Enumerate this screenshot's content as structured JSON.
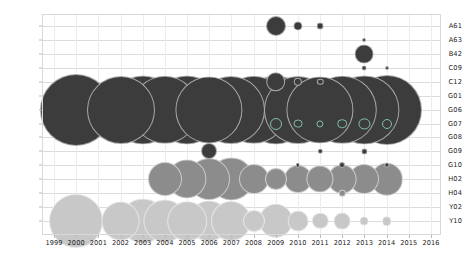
{
  "chart_data": {
    "type": "scatter",
    "title": "",
    "subtitle": "",
    "xlabel": "",
    "ylabel": "",
    "grid": true,
    "legend": "none",
    "bubble_encoding": "area",
    "x": [
      1999,
      2000,
      2001,
      2002,
      2003,
      2004,
      2005,
      2006,
      2007,
      2008,
      2009,
      2010,
      2011,
      2012,
      2013,
      2014,
      2015,
      2016
    ],
    "xlim": [
      1999,
      2016
    ],
    "categories": [
      "A61",
      "A63",
      "B42",
      "C09",
      "C12",
      "G01",
      "G06",
      "G07",
      "G08",
      "G09",
      "G10",
      "H02",
      "H04",
      "Y02",
      "Y10"
    ],
    "ylim": [
      "A61",
      "Y10"
    ],
    "colors": {
      "dark": "#3c3c3c",
      "medium": "#8c8c8c",
      "light": "#c8c8c8",
      "accent_ring": "#7fbfb0",
      "grid": "#dcdcdc",
      "axis_text": "#1d1d1d",
      "background": "#ffffff"
    },
    "points": [
      {
        "category": "A61",
        "year": 2009,
        "value": 38,
        "size": 10.0,
        "color": "#3c3c3c"
      },
      {
        "category": "A61",
        "year": 2010,
        "value": 9,
        "size": 4.6,
        "color": "#3c3c3c"
      },
      {
        "category": "A61",
        "year": 2011,
        "value": 5,
        "size": 3.4,
        "color": "#3c3c3c"
      },
      {
        "category": "A63",
        "year": 2013,
        "value": 2,
        "size": 2.0,
        "color": "#3c3c3c"
      },
      {
        "category": "B42",
        "year": 2013,
        "value": 34,
        "size": 9.4,
        "color": "#3c3c3c"
      },
      {
        "category": "C09",
        "year": 2013,
        "value": 3,
        "size": 2.4,
        "color": "#3c3c3c"
      },
      {
        "category": "C09",
        "year": 2014,
        "value": 2,
        "size": 2.0,
        "color": "#3c3c3c"
      },
      {
        "category": "C12",
        "year": 2009,
        "value": 37,
        "size": 9.8,
        "color": "#3c3c3c"
      },
      {
        "category": "C12",
        "year": 2010,
        "value": 8,
        "size": 4.2,
        "color": "#3c3c3c"
      },
      {
        "category": "C12",
        "year": 2011,
        "value": 5,
        "size": 3.2,
        "color": "#3c3c3c"
      },
      {
        "category": "G06",
        "year": 2000,
        "value": 560,
        "size": 36.0,
        "color": "#3c3c3c"
      },
      {
        "category": "G06",
        "year": 2002,
        "value": 505,
        "size": 34.0,
        "color": "#3c3c3c"
      },
      {
        "category": "G06",
        "year": 2003,
        "value": 520,
        "size": 34.6,
        "color": "#3c3c3c"
      },
      {
        "category": "G06",
        "year": 2004,
        "value": 512,
        "size": 34.2,
        "color": "#3c3c3c"
      },
      {
        "category": "G06",
        "year": 2005,
        "value": 520,
        "size": 34.6,
        "color": "#3c3c3c"
      },
      {
        "category": "G06",
        "year": 2006,
        "value": 498,
        "size": 33.6,
        "color": "#3c3c3c"
      },
      {
        "category": "G06",
        "year": 2007,
        "value": 505,
        "size": 34.0,
        "color": "#3c3c3c"
      },
      {
        "category": "G06",
        "year": 2008,
        "value": 512,
        "size": 34.2,
        "color": "#3c3c3c"
      },
      {
        "category": "G06",
        "year": 2009,
        "value": 520,
        "size": 34.6,
        "color": "#3c3c3c"
      },
      {
        "category": "G06",
        "year": 2010,
        "value": 505,
        "size": 34.0,
        "color": "#3c3c3c"
      },
      {
        "category": "G06",
        "year": 2011,
        "value": 498,
        "size": 33.6,
        "color": "#3c3c3c"
      },
      {
        "category": "G06",
        "year": 2012,
        "value": 512,
        "size": 34.2,
        "color": "#3c3c3c"
      },
      {
        "category": "G06",
        "year": 2013,
        "value": 520,
        "size": 34.6,
        "color": "#3c3c3c"
      },
      {
        "category": "G06",
        "year": 2014,
        "value": 530,
        "size": 35.0,
        "color": "#3c3c3c"
      },
      {
        "category": "G07",
        "year": 2009,
        "value": 14,
        "size": 6.0,
        "color": "#7fbfb0"
      },
      {
        "category": "G07",
        "year": 2010,
        "value": 8,
        "size": 4.4,
        "color": "#7fbfb0"
      },
      {
        "category": "G07",
        "year": 2011,
        "value": 6,
        "size": 3.6,
        "color": "#7fbfb0"
      },
      {
        "category": "G07",
        "year": 2012,
        "value": 9,
        "size": 4.8,
        "color": "#7fbfb0"
      },
      {
        "category": "G07",
        "year": 2013,
        "value": 12,
        "size": 5.6,
        "color": "#7fbfb0"
      },
      {
        "category": "G07",
        "year": 2014,
        "value": 10,
        "size": 5.0,
        "color": "#7fbfb0"
      },
      {
        "category": "G09",
        "year": 2006,
        "value": 42,
        "size": 8.0,
        "color": "#3c3c3c"
      },
      {
        "category": "G09",
        "year": 2011,
        "value": 3,
        "size": 2.2,
        "color": "#3c3c3c"
      },
      {
        "category": "G09",
        "year": 2013,
        "value": 4,
        "size": 2.6,
        "color": "#3c3c3c"
      },
      {
        "category": "G10",
        "year": 2010,
        "value": 3,
        "size": 2.2,
        "color": "#3c3c3c"
      },
      {
        "category": "G10",
        "year": 2012,
        "value": 5,
        "size": 3.0,
        "color": "#3c3c3c"
      },
      {
        "category": "G10",
        "year": 2014,
        "value": 4,
        "size": 2.6,
        "color": "#3c3c3c"
      },
      {
        "category": "H02",
        "year": 2004,
        "value": 150,
        "size": 17.0,
        "color": "#8c8c8c"
      },
      {
        "category": "H02",
        "year": 2005,
        "value": 190,
        "size": 19.6,
        "color": "#8c8c8c"
      },
      {
        "category": "H02",
        "year": 2006,
        "value": 215,
        "size": 21.0,
        "color": "#8c8c8c"
      },
      {
        "category": "H02",
        "year": 2007,
        "value": 225,
        "size": 21.6,
        "color": "#8c8c8c"
      },
      {
        "category": "H02",
        "year": 2008,
        "value": 120,
        "size": 15.0,
        "color": "#8c8c8c"
      },
      {
        "category": "H02",
        "year": 2009,
        "value": 70,
        "size": 11.0,
        "color": "#8c8c8c"
      },
      {
        "category": "H02",
        "year": 2010,
        "value": 110,
        "size": 14.0,
        "color": "#8c8c8c"
      },
      {
        "category": "H02",
        "year": 2011,
        "value": 105,
        "size": 13.6,
        "color": "#8c8c8c"
      },
      {
        "category": "H02",
        "year": 2012,
        "value": 115,
        "size": 14.4,
        "color": "#8c8c8c"
      },
      {
        "category": "H02",
        "year": 2013,
        "value": 120,
        "size": 15.0,
        "color": "#8c8c8c"
      },
      {
        "category": "H02",
        "year": 2014,
        "value": 140,
        "size": 16.2,
        "color": "#8c8c8c"
      },
      {
        "category": "H04",
        "year": 2012,
        "value": 6,
        "size": 3.2,
        "color": "#8c8c8c"
      },
      {
        "category": "Y10",
        "year": 2000,
        "value": 330,
        "size": 27.0,
        "color": "#c8c8c8"
      },
      {
        "category": "Y10",
        "year": 2002,
        "value": 180,
        "size": 19.4,
        "color": "#c8c8c8"
      },
      {
        "category": "Y10",
        "year": 2003,
        "value": 245,
        "size": 22.6,
        "color": "#c8c8c8"
      },
      {
        "category": "Y10",
        "year": 2004,
        "value": 225,
        "size": 21.6,
        "color": "#c8c8c8"
      },
      {
        "category": "Y10",
        "year": 2005,
        "value": 190,
        "size": 19.8,
        "color": "#c8c8c8"
      },
      {
        "category": "Y10",
        "year": 2006,
        "value": 205,
        "size": 20.6,
        "color": "#c8c8c8"
      },
      {
        "category": "Y10",
        "year": 2007,
        "value": 195,
        "size": 20.0,
        "color": "#c8c8c8"
      },
      {
        "category": "Y10",
        "year": 2008,
        "value": 70,
        "size": 11.0,
        "color": "#c8c8c8"
      },
      {
        "category": "Y10",
        "year": 2009,
        "value": 150,
        "size": 17.2,
        "color": "#c8c8c8"
      },
      {
        "category": "Y10",
        "year": 2010,
        "value": 62,
        "size": 10.4,
        "color": "#c8c8c8"
      },
      {
        "category": "Y10",
        "year": 2011,
        "value": 40,
        "size": 8.2,
        "color": "#c8c8c8"
      },
      {
        "category": "Y10",
        "year": 2012,
        "value": 42,
        "size": 8.4,
        "color": "#c8c8c8"
      },
      {
        "category": "Y10",
        "year": 2013,
        "value": 11,
        "size": 4.4,
        "color": "#c8c8c8"
      },
      {
        "category": "Y10",
        "year": 2014,
        "value": 13,
        "size": 4.8,
        "color": "#c8c8c8"
      }
    ]
  }
}
